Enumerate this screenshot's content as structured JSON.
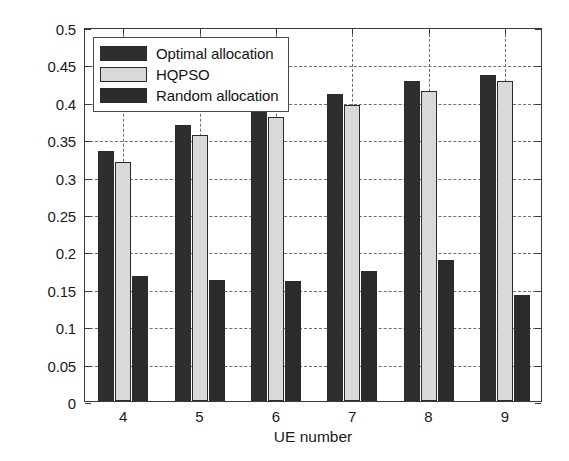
{
  "chart_data": {
    "type": "bar",
    "title": "",
    "xlabel": "UE number",
    "ylabel": "Saved completion time（s）",
    "categories": [
      "4",
      "5",
      "6",
      "7",
      "8",
      "9"
    ],
    "series": [
      {
        "name": "Optimal allocation",
        "color": "#2e2e2e",
        "values": [
          0.334,
          0.369,
          0.393,
          0.41,
          0.428,
          0.436
        ]
      },
      {
        "name": "HQPSO",
        "color": "#d9d9d9",
        "values": [
          0.319,
          0.355,
          0.38,
          0.396,
          0.414,
          0.428
        ]
      },
      {
        "name": "Random allocation",
        "color": "#2b2b2b",
        "values": [
          0.167,
          0.162,
          0.16,
          0.174,
          0.189,
          0.142
        ]
      }
    ],
    "ylim": [
      0,
      0.5
    ],
    "ytick_values": [
      0,
      0.05,
      0.1,
      0.15,
      0.2,
      0.25,
      0.3,
      0.35,
      0.4,
      0.45,
      0.5
    ],
    "ytick_labels": [
      "0",
      "0.05",
      "0.1",
      "0.15",
      "0.2",
      "0.25",
      "0.3",
      "0.35",
      "0.4",
      "0.45",
      "0.5"
    ],
    "xtick_labels": [
      "4",
      "5",
      "6",
      "7",
      "8",
      "9"
    ],
    "grid": true,
    "grid_style": "dashed",
    "legend_position": "top-left",
    "legend_entries": [
      "Optimal allocation",
      "HQPSO",
      "Random allocation"
    ]
  },
  "axes": {
    "y_title": "Saved completion time（s）",
    "x_title": "UE number"
  },
  "legend": {
    "items": [
      {
        "label": "Optimal allocation"
      },
      {
        "label": "HQPSO"
      },
      {
        "label": "Random allocation"
      }
    ]
  }
}
